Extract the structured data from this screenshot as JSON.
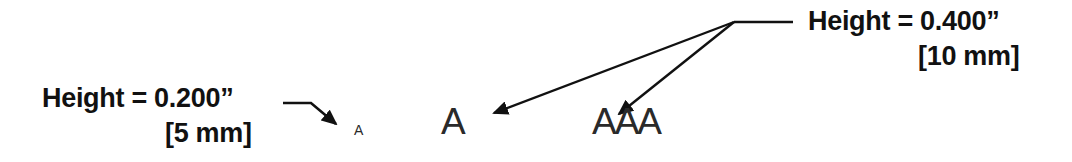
{
  "diagram": {
    "type": "annotated-lettering-size-callout",
    "callouts": [
      {
        "id": "small",
        "label_line1": "Height = 0.200”",
        "label_line2": "[5 mm]",
        "targets": [
          "small-letter"
        ]
      },
      {
        "id": "large",
        "label_line1": "Height = 0.400”",
        "label_line2": "[10 mm]",
        "targets": [
          "large-letter-single",
          "large-letter-triple"
        ]
      }
    ],
    "samples": {
      "small_letter": "A",
      "large_letter_single": "A",
      "large_letter_triple": "AAA"
    },
    "colors": {
      "text": "#111111",
      "sample_text": "#2a2a2a",
      "lines": "#111111",
      "background": "#ffffff"
    }
  }
}
